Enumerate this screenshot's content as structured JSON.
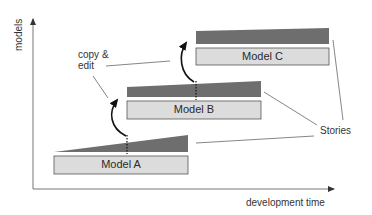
{
  "diagram": {
    "axes": {
      "x_label": "development time",
      "y_label": "models"
    },
    "models": [
      {
        "label": "Model A"
      },
      {
        "label": "Model B"
      },
      {
        "label": "Model C"
      }
    ],
    "annotations": {
      "copy_edit_line1": "copy &",
      "copy_edit_line2": "edit",
      "stories": "Stories"
    },
    "colors": {
      "box_fill": "#dcdcdc",
      "box_stroke": "#555555",
      "wedge_fill": "#6e6e6e",
      "axis": "#555555",
      "leader": "#666666"
    }
  }
}
